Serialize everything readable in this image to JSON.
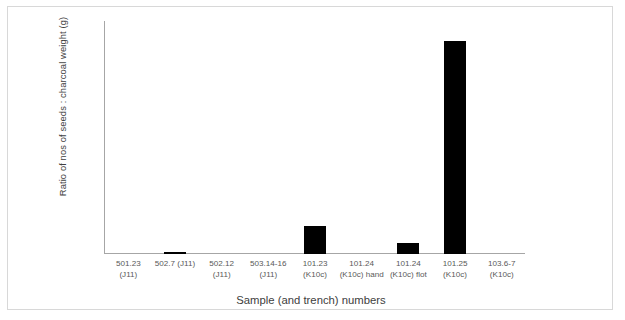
{
  "chart_data": {
    "type": "bar",
    "title": "",
    "xlabel": "Sample (and trench) numbers",
    "ylabel": "Ratio of nos of seeds : charcoal weight (g)",
    "categories": [
      "501.23 (J11)",
      "502.7 (J11)",
      "502.12 (J11)",
      "503.14-16 (J11)",
      "101.23 (K10c)",
      "101.24 (K10c) hand",
      "101.24 (K10c) flot",
      "101.25 (K10c)",
      "103.6-7 (K10c)"
    ],
    "values": [
      0,
      3,
      0,
      0,
      42,
      0,
      16,
      320,
      0
    ],
    "ylim": [
      0,
      350
    ],
    "yticks": [
      0,
      50,
      100,
      150,
      200,
      250,
      300,
      350
    ],
    "grid": false,
    "legend": false,
    "bar_color": "#000000",
    "axis_color": "#a6a6a6"
  }
}
